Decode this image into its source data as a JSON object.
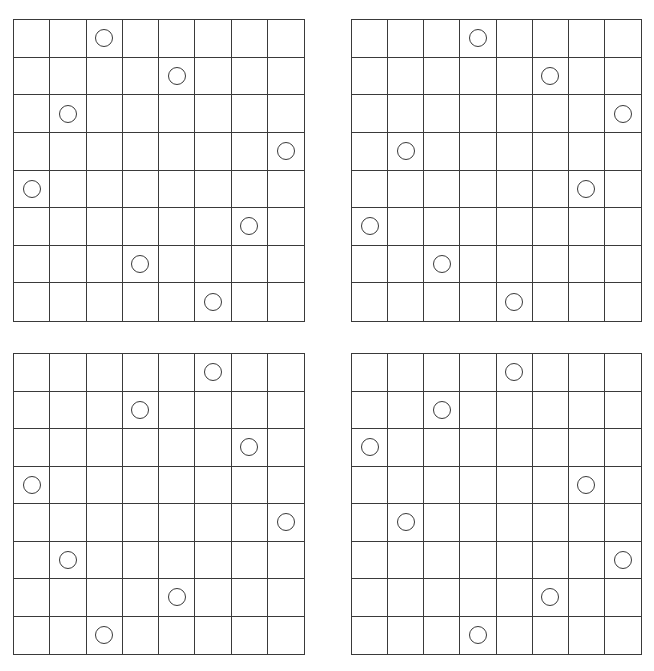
{
  "figure": {
    "grid_size": 8,
    "line_color": "#3a3a3a",
    "background_color": "#ffffff",
    "boards": [
      {
        "name": "top-left",
        "box": {
          "x": 13,
          "y": 19,
          "w": 292,
          "h": 303
        },
        "circle_columns_by_row": [
          2,
          4,
          1,
          7,
          0,
          6,
          3,
          5
        ]
      },
      {
        "name": "top-right",
        "box": {
          "x": 351,
          "y": 19,
          "w": 291,
          "h": 303
        },
        "circle_columns_by_row": [
          3,
          5,
          7,
          1,
          6,
          0,
          2,
          4
        ]
      },
      {
        "name": "bottom-left",
        "box": {
          "x": 13,
          "y": 353,
          "w": 292,
          "h": 302
        },
        "circle_columns_by_row": [
          5,
          3,
          6,
          0,
          7,
          1,
          4,
          2
        ]
      },
      {
        "name": "bottom-right",
        "box": {
          "x": 351,
          "y": 353,
          "w": 291,
          "h": 302
        },
        "circle_columns_by_row": [
          4,
          2,
          0,
          6,
          1,
          7,
          5,
          3
        ]
      }
    ]
  }
}
